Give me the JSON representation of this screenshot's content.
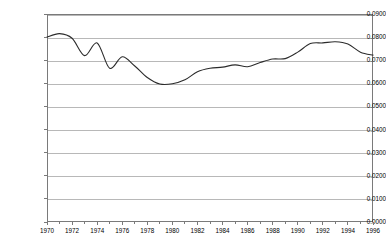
{
  "chart_data": {
    "type": "line",
    "title": "",
    "subtitle": "",
    "xlabel": "",
    "ylabel": "",
    "grid": true,
    "legend": "none",
    "xlim": [
      1970,
      1996
    ],
    "ylim": [
      0.0,
      0.09
    ],
    "ytick_labels": [
      "0.0900",
      "0.0800",
      "0.0700",
      "0.0600",
      "0.0500",
      "0.0400",
      "0.0300",
      "0.0200",
      "0.0100",
      "0.0000"
    ],
    "ytick_values": [
      0.09,
      0.08,
      0.07,
      0.06,
      0.05,
      0.04,
      0.03,
      0.02,
      0.01,
      0.0
    ],
    "xtick_labels": [
      "1970",
      "1972",
      "1974",
      "1976",
      "1978",
      "1980",
      "1982",
      "1984",
      "1986",
      "1988",
      "1990",
      "1992",
      "1994",
      "1996"
    ],
    "xtick_values": [
      1970,
      1972,
      1974,
      1976,
      1978,
      1980,
      1982,
      1984,
      1986,
      1988,
      1990,
      1992,
      1994,
      1996
    ],
    "xminor_values": [
      1971,
      1973,
      1975,
      1977,
      1979,
      1981,
      1983,
      1985,
      1987,
      1989,
      1991,
      1993,
      1995
    ],
    "line_color": "#2b2b2b",
    "grid_color": "#b8b8b8",
    "axis_color": "#7a7a7a",
    "series": [
      {
        "name": "series-1",
        "x": [
          1970,
          1971,
          1972,
          1973,
          1974,
          1975,
          1976,
          1977,
          1978,
          1979,
          1980,
          1981,
          1982,
          1983,
          1984,
          1985,
          1986,
          1987,
          1988,
          1989,
          1990,
          1991,
          1992,
          1993,
          1994,
          1995,
          1996
        ],
        "values": [
          0.08,
          0.0815,
          0.0795,
          0.072,
          0.0775,
          0.0665,
          0.0715,
          0.0675,
          0.0625,
          0.0597,
          0.0598,
          0.0615,
          0.065,
          0.0665,
          0.067,
          0.068,
          0.0672,
          0.069,
          0.0705,
          0.0707,
          0.0735,
          0.0772,
          0.0775,
          0.078,
          0.077,
          0.0735,
          0.0722
        ]
      }
    ]
  }
}
